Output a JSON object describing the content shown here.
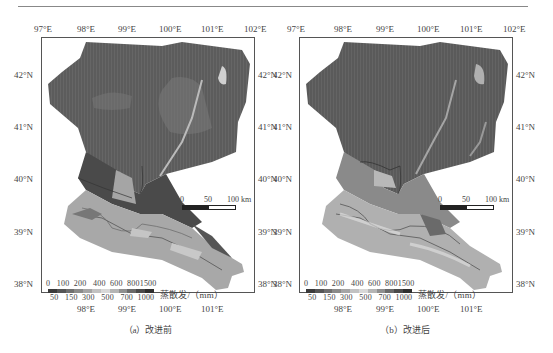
{
  "figure": {
    "panels": [
      {
        "id": "a",
        "caption": "（a）改进前",
        "x_ticks": [
          "97°E",
          "98°E",
          "99°E",
          "100°E",
          "101°E",
          "102°E"
        ],
        "x_ticks_bottom": [
          "98°E",
          "99°E",
          "100°E",
          "101°E"
        ],
        "y_ticks": [
          "42°N",
          "41°N",
          "40°N",
          "39°N",
          "38°N"
        ],
        "scale_bar": {
          "labels": [
            "0",
            "50",
            "100 km"
          ]
        },
        "legend": {
          "title": "蒸散发/（mm）",
          "top_labels": [
            "0",
            "100",
            "200",
            "400",
            "600",
            "800",
            "1500"
          ],
          "bottom_labels": [
            "50",
            "150",
            "300",
            "500",
            "700",
            "1000"
          ]
        }
      },
      {
        "id": "b",
        "caption": "（b）改进后",
        "x_ticks": [
          "97°E",
          "98°E",
          "99°E",
          "100°E",
          "101°E",
          "102°E"
        ],
        "x_ticks_bottom": [
          "98°E",
          "99°E",
          "100°E",
          "101°E"
        ],
        "y_ticks": [
          "42°N",
          "41°N",
          "40°N",
          "39°N",
          "38°N"
        ],
        "scale_bar": {
          "labels": [
            "0",
            "50",
            "100 km"
          ]
        },
        "legend": {
          "title": "蒸散发/（mm）",
          "top_labels": [
            "0",
            "100",
            "200",
            "400",
            "600",
            "800",
            "1500"
          ],
          "bottom_labels": [
            "50",
            "150",
            "300",
            "500",
            "700",
            "1000"
          ]
        }
      }
    ],
    "legend_colors": [
      "#3a3a3a",
      "#555555",
      "#6e6e6e",
      "#8a8a8a",
      "#a5a5a5",
      "#c2c2c2",
      "#d8d8d8",
      "#b5b5b5",
      "#8f8f8f",
      "#6a6a6a",
      "#4a4a4a",
      "#2e2e2e"
    ],
    "colors": {
      "desert_north": "#5e5e5e",
      "upstream_south": "#a8a8a8",
      "frame": "#555555"
    }
  }
}
